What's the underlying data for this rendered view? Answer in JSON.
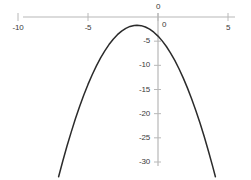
{
  "chart_data": {
    "type": "line",
    "title": "",
    "subtitle": "",
    "xlabel": "",
    "ylabel": "",
    "xlim": [
      -10,
      5
    ],
    "ylim": [
      -30,
      0
    ],
    "grid": false,
    "legend": null,
    "legend_position": "none",
    "line_color": "#2b2b2b",
    "axis_color": "#b8b8b8",
    "label_color": "#3a3a3a",
    "background": "#ffffff",
    "equation": "y = -(x + 1.5)^2 - 1.7",
    "x_ticks": [
      {
        "value": -10,
        "label": "-10"
      },
      {
        "value": -5,
        "label": "-5"
      },
      {
        "value": 0,
        "label": "0"
      },
      {
        "value": 5,
        "label": "5"
      }
    ],
    "y_ticks": [
      {
        "value": 0,
        "label": "0"
      },
      {
        "value": -5,
        "label": "-5"
      },
      {
        "value": -10,
        "label": "-10"
      },
      {
        "value": -15,
        "label": "-15"
      },
      {
        "value": -20,
        "label": "-20"
      },
      {
        "value": -25,
        "label": "-25"
      },
      {
        "value": -30,
        "label": "-30"
      }
    ],
    "x": [
      -7.1,
      -6.8,
      -6.5,
      -6.2,
      -5.9,
      -5.6,
      -5.3,
      -5.0,
      -4.7,
      -4.4,
      -4.1,
      -3.8,
      -3.5,
      -3.2,
      -2.9,
      -2.6,
      -2.3,
      -2.0,
      -1.7,
      -1.5,
      -1.2,
      -0.9,
      -0.6,
      -0.3,
      0.0,
      0.3,
      0.6,
      0.9,
      1.2,
      1.5,
      1.8,
      2.1,
      2.4,
      2.7,
      3.0,
      3.3,
      3.6,
      3.9,
      4.1
    ],
    "values": [
      -33.06,
      -29.78,
      -26.7,
      -23.82,
      -21.06,
      -18.5,
      -16.14,
      -13.95,
      -11.94,
      -10.11,
      -8.46,
      -7.0,
      -5.7,
      -4.59,
      -3.66,
      -2.91,
      -2.34,
      -1.95,
      -1.74,
      -1.7,
      -1.79,
      -2.06,
      -2.51,
      -3.14,
      -3.95,
      -4.94,
      -6.11,
      -7.46,
      -8.99,
      -10.7,
      -12.59,
      -14.66,
      -16.91,
      -19.34,
      -21.95,
      -24.74,
      -27.71,
      -30.86,
      -33.06
    ]
  },
  "axes": {
    "x_axis_name": "horizontal-axis",
    "y_axis_name": "vertical-axis"
  }
}
